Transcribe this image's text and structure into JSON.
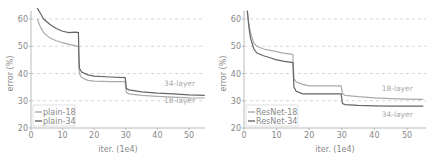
{
  "chart_data": [
    {
      "type": "line",
      "title": "",
      "xlabel": "iter. (1e4)",
      "ylabel": "error (%)",
      "xlim": [
        0,
        55
      ],
      "ylim": [
        20,
        63
      ],
      "xticks": [
        0,
        10,
        20,
        30,
        40,
        50
      ],
      "yticks": [
        20,
        30,
        40,
        50,
        60
      ],
      "grid": "dashed horizontal at y ticks",
      "legend_position": "lower left",
      "annotations": [
        {
          "text": "34-layer",
          "x": 47,
          "y": 35.5
        },
        {
          "text": "18-layer",
          "x": 47,
          "y": 29
        }
      ],
      "series": [
        {
          "name": "plain-18",
          "color": "#aaaaaa",
          "x": [
            2,
            3,
            4,
            6,
            8,
            10,
            12,
            14,
            15,
            15.3,
            16,
            18,
            20,
            25,
            29.8,
            30.2,
            31,
            35,
            40,
            45,
            50,
            55
          ],
          "y": [
            60,
            57,
            55,
            53,
            52,
            51.3,
            50.7,
            50.2,
            50,
            40,
            38.5,
            37.5,
            37.2,
            37,
            37,
            33,
            32.5,
            32,
            31.6,
            31.3,
            31.1,
            31
          ]
        },
        {
          "name": "plain-34",
          "color": "#666666",
          "x": [
            2,
            3,
            4,
            6,
            8,
            10,
            12,
            14,
            15,
            15.3,
            16,
            18,
            20,
            25,
            29.8,
            30.2,
            31,
            35,
            40,
            45,
            50,
            55
          ],
          "y": [
            64,
            62,
            60,
            58,
            56.5,
            55.5,
            55,
            55.2,
            55,
            42,
            40.5,
            39.5,
            39,
            38.7,
            38.5,
            34.5,
            34,
            33.3,
            32.8,
            32.5,
            32.2,
            32
          ]
        }
      ]
    },
    {
      "type": "line",
      "title": "",
      "xlabel": "iter. (1e4)",
      "ylabel": "error (%)",
      "xlim": [
        0,
        55
      ],
      "ylim": [
        20,
        63
      ],
      "xticks": [
        0,
        10,
        20,
        30,
        40,
        50
      ],
      "yticks": [
        20,
        30,
        40,
        50,
        60
      ],
      "grid": "dashed horizontal at y ticks",
      "legend_position": "lower left",
      "annotations": [
        {
          "text": "18-layer",
          "x": 47,
          "y": 33.5
        },
        {
          "text": "34-layer",
          "x": 47,
          "y": 24
        }
      ],
      "series": [
        {
          "name": "ResNet-18",
          "color": "#aaaaaa",
          "x": [
            1,
            1.5,
            2,
            3,
            4,
            6,
            8,
            10,
            12,
            14,
            15,
            15.3,
            16,
            18,
            20,
            25,
            29.8,
            30.2,
            31,
            35,
            40,
            45,
            50,
            55
          ],
          "y": [
            63,
            58,
            55,
            51,
            50,
            49,
            48.5,
            48,
            47.5,
            47.2,
            47,
            38,
            37,
            36,
            35.5,
            35.5,
            35.5,
            32.5,
            32,
            31.5,
            31.1,
            30.8,
            30.6,
            30.5
          ]
        },
        {
          "name": "ResNet-34",
          "color": "#666666",
          "x": [
            1,
            1.5,
            2,
            3,
            4,
            6,
            8,
            10,
            12,
            14,
            15,
            15.3,
            16,
            18,
            20,
            25,
            29.8,
            30.2,
            31,
            35,
            40,
            45,
            50,
            55
          ],
          "y": [
            63,
            57,
            53,
            49,
            47.5,
            46.5,
            45.8,
            45,
            44.5,
            44.2,
            44,
            35,
            33.5,
            32.5,
            32.5,
            32.5,
            32.5,
            29,
            28.6,
            28.3,
            28.1,
            28,
            28,
            28
          ]
        }
      ]
    }
  ]
}
